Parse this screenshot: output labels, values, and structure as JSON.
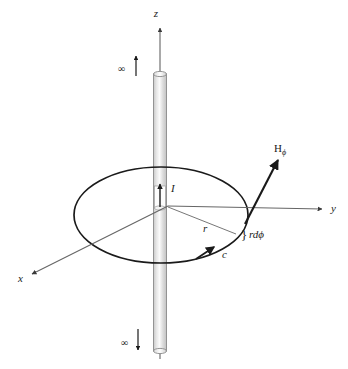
{
  "figure": {
    "background_color": "#ffffff",
    "stroke_color": "#1a1a1a",
    "thin_stroke_color": "#555555",
    "wire_fill_color": "#d4d4d4",
    "wire_highlight_color": "#f2f2f2"
  },
  "axes": {
    "z": {
      "label": "z"
    },
    "y": {
      "label": "y"
    },
    "x": {
      "label": "x"
    }
  },
  "wire": {
    "top_infinity_label": "∞",
    "bottom_infinity_label": "∞",
    "current_label": "I"
  },
  "loop": {
    "contour_label": "c",
    "radius_label": "r"
  },
  "field": {
    "vector_label_base": "H",
    "vector_label_sub": "ϕ"
  },
  "arc_element": {
    "brace": "}",
    "label": "rdϕ"
  }
}
